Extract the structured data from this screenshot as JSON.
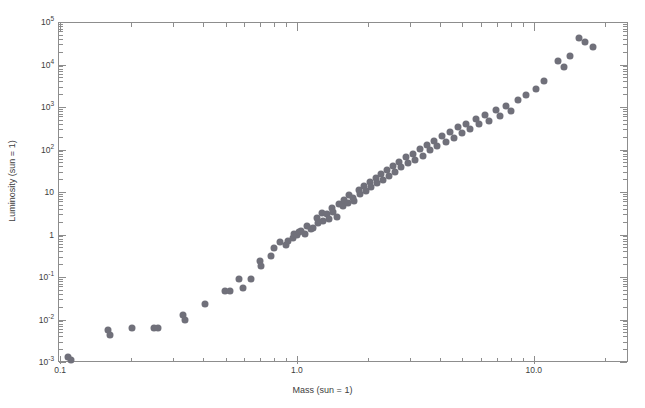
{
  "chart_data": {
    "type": "scatter",
    "title": "",
    "xlabel": "Mass (sun = 1)",
    "ylabel": "Luminosity (sun = 1)",
    "xscale": "log",
    "yscale": "log",
    "xlim": [
      0.098,
      25.0
    ],
    "ylim": [
      0.001,
      100000
    ],
    "grid": false,
    "legend": null,
    "xticks": [
      {
        "value": 0.1,
        "label": "0.1",
        "major": true
      },
      {
        "value": 1.0,
        "label": "1.0",
        "major": true
      },
      {
        "value": 10.0,
        "label": "10.0",
        "major": true
      }
    ],
    "xminorticks": [
      0.2,
      0.3,
      0.4,
      0.5,
      0.6,
      0.7,
      0.8,
      0.9,
      2,
      3,
      4,
      5,
      6,
      7,
      8,
      9,
      20
    ],
    "yticks": [
      {
        "value": 100000,
        "mantissa": "10",
        "exponent": "5",
        "major": true
      },
      {
        "value": 10000,
        "mantissa": "10",
        "exponent": "4",
        "major": true
      },
      {
        "value": 1000,
        "mantissa": "10",
        "exponent": "3",
        "major": true
      },
      {
        "value": 100,
        "mantissa": "10",
        "exponent": "2",
        "major": true
      },
      {
        "value": 10,
        "mantissa": "10",
        "exponent": "",
        "major": true
      },
      {
        "value": 1,
        "mantissa": "1",
        "exponent": "",
        "major": true
      },
      {
        "value": 0.1,
        "mantissa": "10",
        "exponent": "-1",
        "major": true
      },
      {
        "value": 0.01,
        "mantissa": "10",
        "exponent": "-2",
        "major": true
      },
      {
        "value": 0.001,
        "mantissa": "10",
        "exponent": "-3",
        "major": true
      }
    ],
    "marker": {
      "shape": "circle",
      "color": "#70707a",
      "size_px": 7
    },
    "axis_color": "#8d8d8d",
    "points": [
      [
        0.108,
        0.0013
      ],
      [
        0.111,
        0.00112
      ],
      [
        0.16,
        0.0056
      ],
      [
        0.162,
        0.0043
      ],
      [
        0.202,
        0.0063
      ],
      [
        0.25,
        0.0064
      ],
      [
        0.258,
        0.0064
      ],
      [
        0.33,
        0.0125
      ],
      [
        0.336,
        0.01
      ],
      [
        0.41,
        0.023
      ],
      [
        0.495,
        0.048
      ],
      [
        0.52,
        0.047
      ],
      [
        0.57,
        0.088
      ],
      [
        0.59,
        0.056
      ],
      [
        0.64,
        0.088
      ],
      [
        0.7,
        0.24
      ],
      [
        0.705,
        0.185
      ],
      [
        0.78,
        0.31
      ],
      [
        0.8,
        0.47
      ],
      [
        0.85,
        0.66
      ],
      [
        0.9,
        0.57
      ],
      [
        0.915,
        0.72
      ],
      [
        0.96,
        0.83
      ],
      [
        0.975,
        1.05
      ],
      [
        1.0,
        1.0
      ],
      [
        1.02,
        1.15
      ],
      [
        1.045,
        1.2
      ],
      [
        1.08,
        1.05
      ],
      [
        1.1,
        1.6
      ],
      [
        1.15,
        1.35
      ],
      [
        1.165,
        1.45
      ],
      [
        1.21,
        2.4
      ],
      [
        1.23,
        1.85
      ],
      [
        1.27,
        3.2
      ],
      [
        1.29,
        2.1
      ],
      [
        1.34,
        3.0
      ],
      [
        1.36,
        2.3
      ],
      [
        1.4,
        4.3
      ],
      [
        1.42,
        3.4
      ],
      [
        1.47,
        2.6
      ],
      [
        1.5,
        5.2
      ],
      [
        1.56,
        4.6
      ],
      [
        1.58,
        6.4
      ],
      [
        1.64,
        5.6
      ],
      [
        1.66,
        8.3
      ],
      [
        1.72,
        7.4
      ],
      [
        1.75,
        6.1
      ],
      [
        1.82,
        11.0
      ],
      [
        1.85,
        9.0
      ],
      [
        1.92,
        14.0
      ],
      [
        1.95,
        10.5
      ],
      [
        2.03,
        17.5
      ],
      [
        2.06,
        13.0
      ],
      [
        2.15,
        21.0
      ],
      [
        2.18,
        16.0
      ],
      [
        2.26,
        26.0
      ],
      [
        2.3,
        19.5
      ],
      [
        2.4,
        33.0
      ],
      [
        2.44,
        24.0
      ],
      [
        2.55,
        42.0
      ],
      [
        2.6,
        30.0
      ],
      [
        2.7,
        52.0
      ],
      [
        2.76,
        38.0
      ],
      [
        2.88,
        66.0
      ],
      [
        2.95,
        47.0
      ],
      [
        3.08,
        80.0
      ],
      [
        3.15,
        58.0
      ],
      [
        3.3,
        105.0
      ],
      [
        3.4,
        72.0
      ],
      [
        3.55,
        130.0
      ],
      [
        3.65,
        95.0
      ],
      [
        3.8,
        160.0
      ],
      [
        3.9,
        118.0
      ],
      [
        4.1,
        205.0
      ],
      [
        4.25,
        150.0
      ],
      [
        4.45,
        255.0
      ],
      [
        4.6,
        190.0
      ],
      [
        4.8,
        330.0
      ],
      [
        5.0,
        240.0
      ],
      [
        5.2,
        400.0
      ],
      [
        5.4,
        300.0
      ],
      [
        5.7,
        520.0
      ],
      [
        5.9,
        390.0
      ],
      [
        6.2,
        640.0
      ],
      [
        6.5,
        480.0
      ],
      [
        6.9,
        840.0
      ],
      [
        7.2,
        620.0
      ],
      [
        7.6,
        1050.0
      ],
      [
        8.0,
        790.0
      ],
      [
        8.6,
        1450.0
      ],
      [
        9.3,
        1900.0
      ],
      [
        10.2,
        2600.0
      ],
      [
        11.0,
        4100.0
      ],
      [
        12.6,
        12000.0
      ],
      [
        13.4,
        8600.0
      ],
      [
        14.2,
        16000.0
      ],
      [
        15.6,
        42000.0
      ],
      [
        16.5,
        33000.0
      ],
      [
        17.8,
        26000.0
      ]
    ]
  }
}
